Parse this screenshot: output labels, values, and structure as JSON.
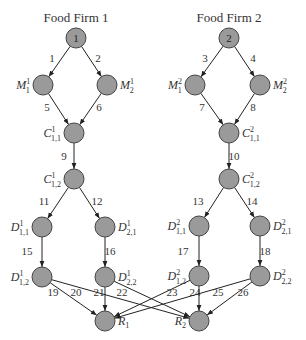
{
  "diagram": {
    "titles": [
      {
        "text": "Food Firm 1",
        "x": 76,
        "y": 22
      },
      {
        "text": "Food Firm 2",
        "x": 229,
        "y": 22
      }
    ],
    "node_color": "#9a9a9a",
    "nodes": [
      {
        "id": "F1",
        "label": "1",
        "x": 76,
        "y": 38,
        "inner": true
      },
      {
        "id": "F2",
        "label": "2",
        "x": 229,
        "y": 38,
        "inner": true
      },
      {
        "id": "M11",
        "base": "M",
        "sub": "1",
        "sup": "1",
        "x": 43,
        "y": 85,
        "side": "left"
      },
      {
        "id": "M21",
        "base": "M",
        "sub": "2",
        "sup": "1",
        "x": 107,
        "y": 85,
        "side": "right"
      },
      {
        "id": "M12",
        "base": "M",
        "sub": "1",
        "sup": "2",
        "x": 195,
        "y": 85,
        "side": "left"
      },
      {
        "id": "M22",
        "base": "M",
        "sub": "2",
        "sup": "2",
        "x": 260,
        "y": 85,
        "side": "right"
      },
      {
        "id": "C111",
        "base": "C",
        "sub": "1,1",
        "sup": "1",
        "x": 74,
        "y": 133,
        "side": "left"
      },
      {
        "id": "C121",
        "base": "C",
        "sub": "1,2",
        "sup": "1",
        "x": 74,
        "y": 179,
        "side": "left"
      },
      {
        "id": "C112",
        "base": "C",
        "sub": "1,1",
        "sup": "2",
        "x": 229,
        "y": 133,
        "side": "right"
      },
      {
        "id": "C122",
        "base": "C",
        "sub": "1,2",
        "sup": "2",
        "x": 229,
        "y": 179,
        "side": "right"
      },
      {
        "id": "D111",
        "base": "D",
        "sub": "1,1",
        "sup": "1",
        "x": 42,
        "y": 227,
        "side": "left"
      },
      {
        "id": "D211",
        "base": "D",
        "sub": "2,1",
        "sup": "1",
        "x": 105,
        "y": 227,
        "side": "right"
      },
      {
        "id": "D121",
        "base": "D",
        "sub": "1,2",
        "sup": "1",
        "x": 42,
        "y": 277,
        "side": "left"
      },
      {
        "id": "D221",
        "base": "D",
        "sub": "2,2",
        "sup": "1",
        "x": 105,
        "y": 277,
        "side": "right"
      },
      {
        "id": "D112",
        "base": "D",
        "sub": "1,1",
        "sup": "2",
        "x": 199,
        "y": 226,
        "side": "left"
      },
      {
        "id": "D212",
        "base": "D",
        "sub": "2,1",
        "sup": "2",
        "x": 260,
        "y": 226,
        "side": "right"
      },
      {
        "id": "D122",
        "base": "D",
        "sub": "1,2",
        "sup": "2",
        "x": 199,
        "y": 276,
        "side": "left"
      },
      {
        "id": "D222",
        "base": "D",
        "sub": "2,2",
        "sup": "2",
        "x": 260,
        "y": 276,
        "side": "right"
      },
      {
        "id": "R1",
        "base": "R",
        "sub": "1",
        "sup": "",
        "x": 105,
        "y": 321,
        "side": "right"
      },
      {
        "id": "R2",
        "base": "R",
        "sub": "2",
        "sup": "",
        "x": 199,
        "y": 321,
        "side": "left"
      }
    ],
    "edges": [
      {
        "label": "1",
        "from": "F1",
        "to": "M11",
        "lx": 52,
        "ly": 62
      },
      {
        "label": "2",
        "from": "F1",
        "to": "M21",
        "lx": 98,
        "ly": 62
      },
      {
        "label": "3",
        "from": "F2",
        "to": "M12",
        "lx": 205,
        "ly": 62
      },
      {
        "label": "4",
        "from": "F2",
        "to": "M22",
        "lx": 253,
        "ly": 62
      },
      {
        "label": "5",
        "from": "M11",
        "to": "C111",
        "lx": 47,
        "ly": 111
      },
      {
        "label": "6",
        "from": "M21",
        "to": "C111",
        "lx": 99,
        "ly": 111
      },
      {
        "label": "7",
        "from": "M12",
        "to": "C112",
        "lx": 202,
        "ly": 111
      },
      {
        "label": "8",
        "from": "M22",
        "to": "C112",
        "lx": 253,
        "ly": 111
      },
      {
        "label": "9",
        "from": "C111",
        "to": "C121",
        "lx": 64,
        "ly": 160
      },
      {
        "label": "10",
        "from": "C112",
        "to": "C122",
        "lx": 234,
        "ly": 160
      },
      {
        "label": "11",
        "from": "C121",
        "to": "D111",
        "lx": 44,
        "ly": 205
      },
      {
        "label": "12",
        "from": "C121",
        "to": "D211",
        "lx": 97,
        "ly": 205
      },
      {
        "label": "13",
        "from": "C122",
        "to": "D112",
        "lx": 198,
        "ly": 205
      },
      {
        "label": "14",
        "from": "C122",
        "to": "D212",
        "lx": 252,
        "ly": 205
      },
      {
        "label": "15",
        "from": "D111",
        "to": "D121",
        "lx": 27,
        "ly": 255
      },
      {
        "label": "16",
        "from": "D211",
        "to": "D221",
        "lx": 110,
        "ly": 255
      },
      {
        "label": "17",
        "from": "D112",
        "to": "D122",
        "lx": 183,
        "ly": 255
      },
      {
        "label": "18",
        "from": "D212",
        "to": "D222",
        "lx": 265,
        "ly": 255
      },
      {
        "label": "19",
        "from": "D121",
        "to": "R1",
        "lx": 53,
        "ly": 296
      },
      {
        "label": "20",
        "from": "D121",
        "to": "R2",
        "lx": 76,
        "ly": 296
      },
      {
        "label": "21",
        "from": "D221",
        "to": "R1",
        "lx": 99,
        "ly": 296
      },
      {
        "label": "22",
        "from": "D221",
        "to": "R2",
        "lx": 122,
        "ly": 296
      },
      {
        "label": "23",
        "from": "D122",
        "to": "R1",
        "lx": 172,
        "ly": 296
      },
      {
        "label": "24",
        "from": "D122",
        "to": "R2",
        "lx": 195,
        "ly": 296
      },
      {
        "label": "25",
        "from": "D222",
        "to": "R1",
        "lx": 218,
        "ly": 296
      },
      {
        "label": "26",
        "from": "D222",
        "to": "R2",
        "lx": 243,
        "ly": 296
      }
    ]
  }
}
